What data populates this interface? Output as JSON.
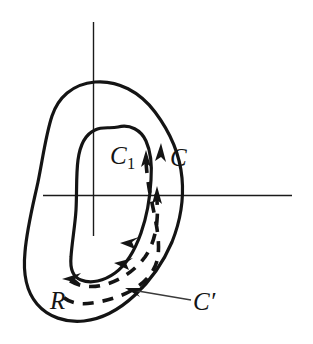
{
  "figure": {
    "width": 313,
    "height": 344,
    "background_color": "#ffffff",
    "ink_color": "#141414",
    "axes": {
      "vertical_label": "vertical-axis",
      "horizontal_label": "horizontal-axis",
      "origin_x": 93,
      "origin_y": 195
    },
    "labels": {
      "outer_contour": "C",
      "inner_contour_base": "C",
      "inner_contour_subscript": "1",
      "region": "R",
      "deformed_contour_base": "C",
      "deformed_contour_prime": "′"
    },
    "curves": {
      "outer_name": "outer-boundary-curve",
      "inner_name": "inner-boundary-curve",
      "dashed_name": "deformed-contour-dashed"
    },
    "arrow_count": 6,
    "leader_line": "pointer-from-c-prime-label"
  }
}
